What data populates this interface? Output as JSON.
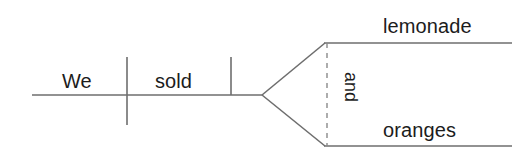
{
  "diagram": {
    "type": "reed-kellogg-sentence-diagram",
    "sentence": "We sold lemonade and oranges.",
    "canvas": {
      "width": 532,
      "height": 160,
      "background": "#ffffff"
    },
    "colors": {
      "line": "#6e6e6e",
      "dashed_line": "#8a8a8a",
      "text": "#1c1c1c",
      "background": "#ffffff"
    },
    "labels": {
      "subject": "We",
      "verb": "sold",
      "object_first": "lemonade",
      "object_second": "oranges",
      "conjunction": "and"
    },
    "parts": [
      {
        "role": "subject",
        "text": "We"
      },
      {
        "role": "verb",
        "text": "sold"
      },
      {
        "role": "direct-object",
        "text": "lemonade"
      },
      {
        "role": "coordinating-conjunction",
        "text": "and"
      },
      {
        "role": "direct-object",
        "text": "oranges"
      }
    ]
  }
}
